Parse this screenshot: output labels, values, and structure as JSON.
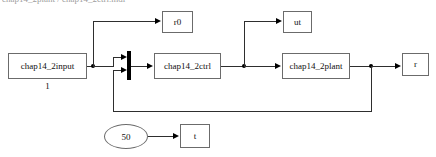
{
  "diagram": {
    "title_strip": "chap14_2plant / chap14_2ctrl.mdl",
    "blocks": {
      "input": {
        "label": "chap14_2input",
        "caption": "1"
      },
      "ctrl": {
        "label": "chap14_2ctrl"
      },
      "plant": {
        "label": "chap14_2plant"
      },
      "scope_r0": {
        "label": "r0"
      },
      "scope_ut": {
        "label": "ut"
      },
      "scope_r": {
        "label": "r"
      },
      "scope_t": {
        "label": "t"
      },
      "clock": {
        "label": "50"
      }
    },
    "colors": {
      "wire": "#2e2e2e",
      "block_border": "#6b6b6b",
      "sum_bar": "#000000",
      "background": "#ffffff",
      "text": "#111111"
    }
  }
}
